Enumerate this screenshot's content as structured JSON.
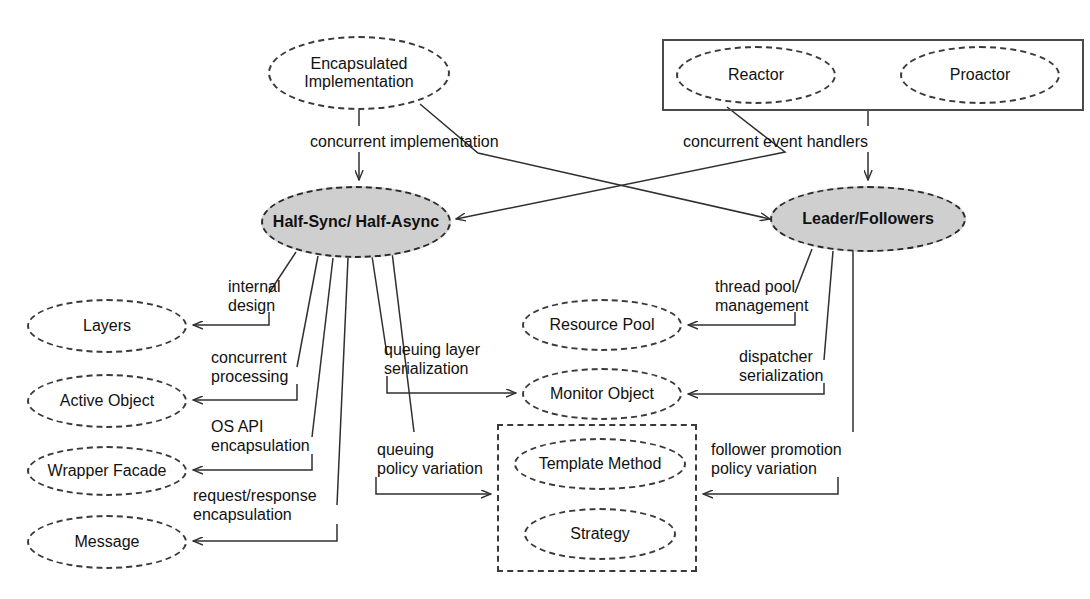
{
  "diagram": {
    "colors": {
      "background": "#ffffff",
      "stroke": "#3a3a3a",
      "text": "#111111",
      "highlight_fill": "#cfcfcf"
    },
    "nodes": [
      {
        "id": "encapsulated-implementation",
        "label": "Encapsulated\nImplementation",
        "shape": "ellipse-dashed",
        "x": 268,
        "y": 36,
        "w": 182,
        "h": 74,
        "filled": false
      },
      {
        "id": "reactor",
        "label": "Reactor",
        "shape": "ellipse-dashed",
        "x": 676,
        "y": 46,
        "w": 160,
        "h": 58,
        "filled": false
      },
      {
        "id": "proactor",
        "label": "Proactor",
        "shape": "ellipse-dashed",
        "x": 900,
        "y": 46,
        "w": 160,
        "h": 58,
        "filled": false
      },
      {
        "id": "half-sync-half-async",
        "label": "Half-Sync/\nHalf-Async",
        "shape": "ellipse-dashed-filled",
        "x": 261,
        "y": 186,
        "w": 190,
        "h": 72,
        "filled": true
      },
      {
        "id": "leader-followers",
        "label": "Leader/Followers",
        "shape": "ellipse-dashed-filled",
        "x": 770,
        "y": 186,
        "w": 196,
        "h": 66,
        "filled": true
      },
      {
        "id": "layers",
        "label": "Layers",
        "shape": "ellipse-dashed",
        "x": 27,
        "y": 299,
        "w": 160,
        "h": 54,
        "filled": false
      },
      {
        "id": "active-object",
        "label": "Active Object",
        "shape": "ellipse-dashed",
        "x": 27,
        "y": 374,
        "w": 160,
        "h": 54,
        "filled": false
      },
      {
        "id": "wrapper-facade",
        "label": "Wrapper Facade",
        "shape": "ellipse-dashed",
        "x": 27,
        "y": 446,
        "w": 160,
        "h": 50,
        "filled": false
      },
      {
        "id": "message",
        "label": "Message",
        "shape": "ellipse-dashed",
        "x": 27,
        "y": 515,
        "w": 160,
        "h": 54,
        "filled": false
      },
      {
        "id": "resource-pool",
        "label": "Resource Pool",
        "shape": "ellipse-dashed",
        "x": 522,
        "y": 299,
        "w": 160,
        "h": 52,
        "filled": false
      },
      {
        "id": "monitor-object",
        "label": "Monitor Object",
        "shape": "ellipse-dashed",
        "x": 522,
        "y": 368,
        "w": 160,
        "h": 52,
        "filled": false
      },
      {
        "id": "template-method",
        "label": "Template Method",
        "shape": "ellipse-dashed",
        "x": 514,
        "y": 438,
        "w": 172,
        "h": 52,
        "filled": false
      },
      {
        "id": "strategy",
        "label": "Strategy",
        "shape": "ellipse-dashed",
        "x": 524,
        "y": 508,
        "w": 152,
        "h": 52,
        "filled": false
      }
    ],
    "containers": [
      {
        "id": "event-demux-box",
        "style": "solid",
        "x": 662,
        "y": 39,
        "w": 422,
        "h": 72
      },
      {
        "id": "variation-box",
        "style": "dashed",
        "x": 497,
        "y": 424,
        "w": 200,
        "h": 148
      }
    ],
    "edge_labels": [
      {
        "id": "concurrent-implementation",
        "text": "concurrent implementation",
        "x": 310,
        "y": 133,
        "align": "left"
      },
      {
        "id": "concurrent-event-handlers",
        "text": "concurrent event handlers",
        "x": 683,
        "y": 133,
        "align": "left"
      },
      {
        "id": "internal-design",
        "text": "internal\ndesign",
        "x": 228,
        "y": 278,
        "align": "left"
      },
      {
        "id": "concurrent-processing",
        "text": "concurrent\nprocessing",
        "x": 211,
        "y": 349,
        "align": "left"
      },
      {
        "id": "os-api-encapsulation",
        "text": "OS API\nencapsulation",
        "x": 211,
        "y": 418,
        "align": "left"
      },
      {
        "id": "request-response-encapsulation",
        "text": "request/response\nencapsulation",
        "x": 193,
        "y": 487,
        "align": "left"
      },
      {
        "id": "queuing-layer-serialization",
        "text": "queuing layer\nserialization",
        "x": 384,
        "y": 341,
        "align": "left"
      },
      {
        "id": "queuing-policy-variation",
        "text": "queuing\npolicy variation",
        "x": 377,
        "y": 441,
        "align": "left"
      },
      {
        "id": "thread-pool-management",
        "text": "thread pool\nmanagement",
        "x": 715,
        "y": 278,
        "align": "left"
      },
      {
        "id": "dispatcher-serialization",
        "text": "dispatcher\nserialization",
        "x": 739,
        "y": 348,
        "align": "left"
      },
      {
        "id": "follower-promotion-policy-variation",
        "text": "follower promotion\npolicy variation",
        "x": 711,
        "y": 441,
        "align": "left"
      }
    ]
  }
}
